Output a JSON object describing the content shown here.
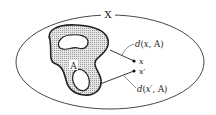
{
  "diagram": {
    "space_label": "X",
    "set_label": "A",
    "points": [
      {
        "label": "x"
      },
      {
        "label": "x′"
      }
    ],
    "distances": [
      {
        "func": "d",
        "open": "(",
        "arg": "x",
        "sep": ", ",
        "set": "A",
        "close": ")"
      },
      {
        "func": "d",
        "open": "(",
        "arg": "x′",
        "sep": ", ",
        "set": "A",
        "close": ")"
      }
    ],
    "colors": {
      "stroke": "#333333",
      "set_fill": "#c8c8c8",
      "background": "#ffffff"
    }
  }
}
